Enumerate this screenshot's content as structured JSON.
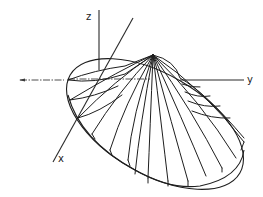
{
  "figure": {
    "axes": {
      "x_label": "x",
      "y_label": "y",
      "z_label": "z"
    },
    "colors": {
      "line": "#1e1e1e",
      "background": "#ffffff"
    }
  }
}
